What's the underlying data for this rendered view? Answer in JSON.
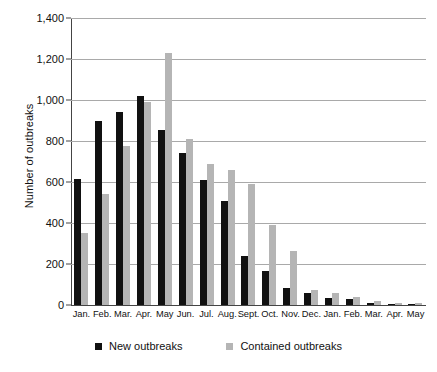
{
  "chart_data": {
    "type": "bar",
    "title": "",
    "subtitle": "",
    "xlabel": "",
    "ylabel": "Number of outbreaks",
    "ylim": [
      0,
      1400
    ],
    "ytick_step": 200,
    "yticks": [
      "0",
      "200",
      "400",
      "600",
      "800",
      "1,000",
      "1,200",
      "1,400"
    ],
    "ytick_values": [
      0,
      200,
      400,
      600,
      800,
      1000,
      1200,
      1400
    ],
    "grid": "horizontal",
    "legend_position": "bottom-center",
    "categories": [
      "Jan.",
      "Feb.",
      "Mar.",
      "Apr.",
      "May",
      "Jun.",
      "Jul.",
      "Aug.",
      "Sept.",
      "Oct.",
      "Nov.",
      "Dec.",
      "Jan.",
      "Feb.",
      "Mar.",
      "Apr.",
      "May"
    ],
    "series": [
      {
        "name": "New outbreaks",
        "color": "#111111",
        "values": [
          615,
          900,
          940,
          1020,
          855,
          740,
          610,
          505,
          240,
          165,
          85,
          60,
          35,
          30,
          12,
          6,
          4
        ]
      },
      {
        "name": "Contained outbreaks",
        "color": "#b5b5b5",
        "values": [
          350,
          540,
          775,
          990,
          1230,
          810,
          690,
          660,
          590,
          390,
          265,
          75,
          60,
          40,
          18,
          10,
          12
        ]
      }
    ],
    "annotations": []
  },
  "legend": {
    "items": [
      {
        "label": "New outbreaks",
        "swatch": "black-square-icon"
      },
      {
        "label": "Contained outbreaks",
        "swatch": "gray-square-icon"
      }
    ]
  }
}
